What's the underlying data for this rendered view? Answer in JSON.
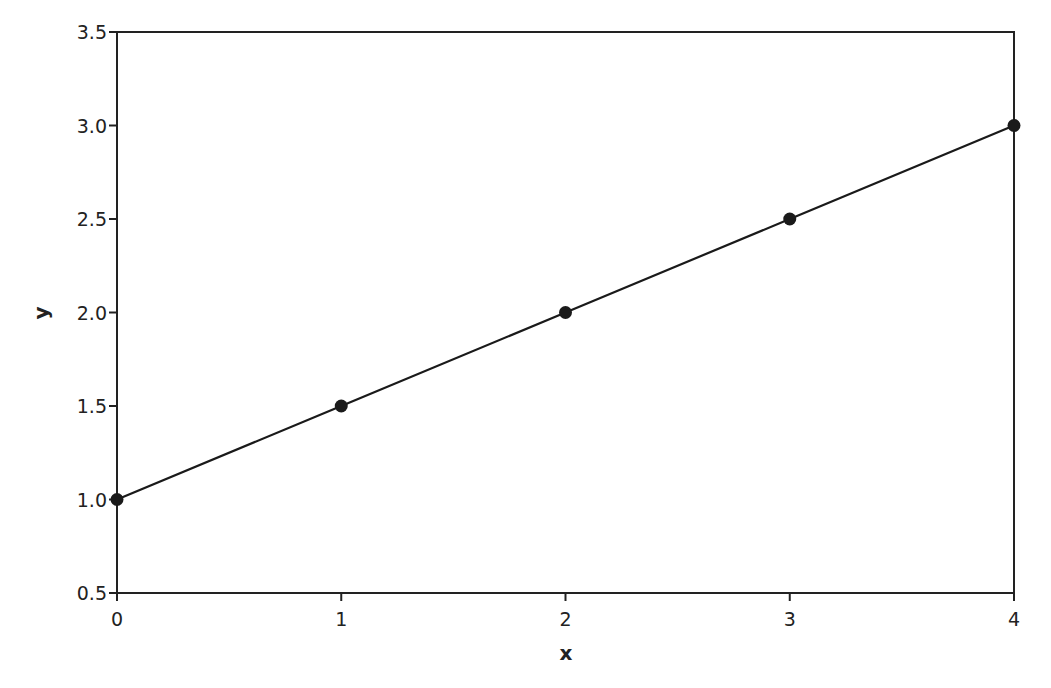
{
  "chart_data": {
    "type": "line",
    "title": "",
    "xlabel": "x",
    "ylabel": "y",
    "x": [
      0,
      1,
      2,
      3,
      4
    ],
    "series": [
      {
        "name": "y",
        "values": [
          1.0,
          1.5,
          2.0,
          2.5,
          3.0
        ],
        "markers": true,
        "color": "#1a1a1a"
      }
    ],
    "xlim": [
      0,
      4
    ],
    "ylim": [
      0.5,
      3.5
    ],
    "xticks": [
      "0",
      "1",
      "2",
      "3",
      "4"
    ],
    "yticks": [
      "0.5",
      "1.0",
      "1.5",
      "2.0",
      "2.5",
      "3.0",
      "3.5"
    ],
    "grid": false,
    "legend": null
  }
}
